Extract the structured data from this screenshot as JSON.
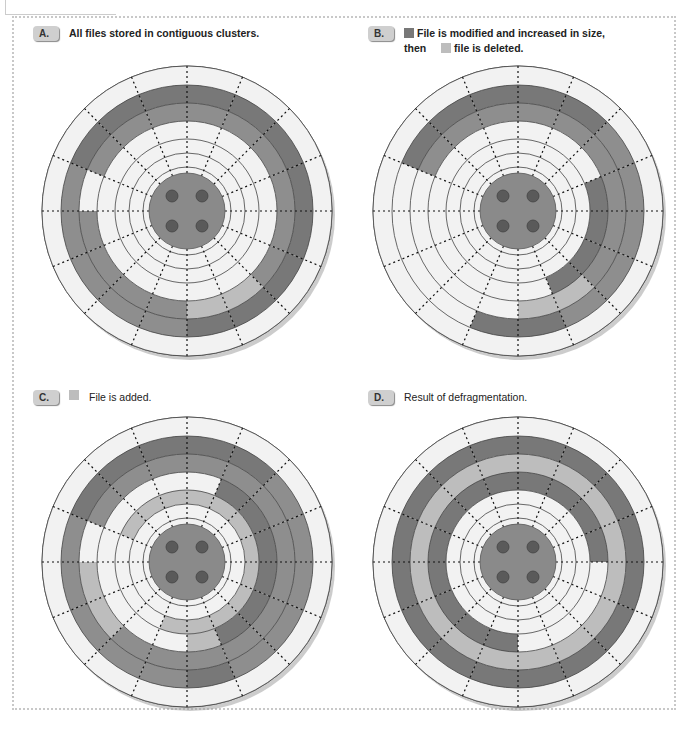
{
  "colors": {
    "white": "#f2f2f2",
    "dark": "#787878",
    "medium": "#8e8e8e",
    "light": "#bdbdbd",
    "hub": "#8a8a8a",
    "hole": "#5a5a5a"
  },
  "panels": [
    {
      "id": "A",
      "badge": "A.",
      "line1": "All files stored in contiguous clusters.",
      "line2": "",
      "swatch1": "",
      "swatch2": ""
    },
    {
      "id": "B",
      "badge": "B.",
      "line1": "File is modified and increased in size,",
      "line2_prefix": "then",
      "line2": "file is deleted.",
      "swatch1": "dark",
      "swatch2": "light"
    },
    {
      "id": "C",
      "badge": "C.",
      "line1": "File is added.",
      "line2": "",
      "swatch1": "light",
      "swatch2": ""
    },
    {
      "id": "D",
      "badge": "D.",
      "line1": "Result of defragmentation.",
      "line2": "",
      "swatch1": "",
      "swatch2": ""
    }
  ],
  "disks": [
    {
      "id": "A",
      "cx": 187,
      "cy": 211,
      "tracks": [
        [
          0,
          0,
          0,
          0,
          0,
          0,
          0,
          0,
          0,
          0,
          0,
          0,
          0,
          0,
          0,
          0
        ],
        [
          1,
          1,
          1,
          1,
          1,
          1,
          1,
          1,
          2,
          2,
          2,
          2,
          2,
          1,
          1,
          1
        ],
        [
          2,
          2,
          2,
          2,
          2,
          2,
          3,
          3,
          2,
          2,
          2,
          2,
          0,
          2,
          2,
          2
        ],
        [
          0,
          0,
          0,
          0,
          0,
          0,
          0,
          0,
          0,
          0,
          0,
          0,
          0,
          0,
          0,
          0
        ],
        [
          0,
          0,
          0,
          0,
          0,
          0,
          0,
          0,
          0,
          0,
          0,
          0,
          0,
          0,
          0,
          0
        ],
        [
          0,
          0,
          0,
          0,
          0,
          0,
          0,
          0,
          0,
          0,
          0,
          0,
          0,
          0,
          0,
          0
        ]
      ]
    },
    {
      "id": "B",
      "cx": 518,
      "cy": 211,
      "tracks": [
        [
          0,
          0,
          0,
          0,
          0,
          0,
          0,
          0,
          0,
          0,
          0,
          0,
          0,
          0,
          0,
          0
        ],
        [
          1,
          1,
          2,
          2,
          2,
          2,
          2,
          1,
          1,
          0,
          0,
          0,
          0,
          1,
          1,
          1
        ],
        [
          2,
          2,
          2,
          2,
          2,
          2,
          3,
          3,
          0,
          0,
          0,
          0,
          0,
          2,
          2,
          2
        ],
        [
          0,
          0,
          0,
          1,
          1,
          1,
          1,
          0,
          0,
          0,
          0,
          0,
          0,
          0,
          0,
          0
        ],
        [
          0,
          0,
          0,
          0,
          0,
          0,
          0,
          0,
          0,
          0,
          0,
          0,
          0,
          0,
          0,
          0
        ],
        [
          0,
          0,
          0,
          0,
          0,
          0,
          0,
          0,
          0,
          0,
          0,
          0,
          0,
          0,
          0,
          0
        ]
      ]
    },
    {
      "id": "C",
      "cx": 187,
      "cy": 562,
      "tracks": [
        [
          0,
          0,
          0,
          0,
          0,
          0,
          0,
          0,
          0,
          0,
          0,
          0,
          0,
          0,
          0,
          0
        ],
        [
          1,
          1,
          2,
          2,
          2,
          2,
          2,
          1,
          2,
          2,
          2,
          2,
          2,
          1,
          1,
          1
        ],
        [
          2,
          2,
          2,
          2,
          2,
          2,
          2,
          2,
          2,
          2,
          3,
          3,
          0,
          2,
          2,
          2
        ],
        [
          0,
          1,
          1,
          1,
          1,
          1,
          1,
          3,
          0,
          0,
          0,
          0,
          0,
          0,
          0,
          0
        ],
        [
          3,
          3,
          3,
          3,
          3,
          3,
          3,
          3,
          3,
          0,
          0,
          0,
          0,
          3,
          3,
          3
        ],
        [
          0,
          0,
          0,
          0,
          0,
          0,
          0,
          0,
          0,
          0,
          0,
          0,
          0,
          0,
          0,
          0
        ]
      ]
    },
    {
      "id": "D",
      "cx": 518,
      "cy": 562,
      "tracks": [
        [
          0,
          0,
          0,
          0,
          0,
          0,
          0,
          0,
          0,
          0,
          0,
          0,
          0,
          0,
          0,
          0
        ],
        [
          1,
          1,
          1,
          1,
          1,
          1,
          1,
          1,
          1,
          1,
          1,
          1,
          1,
          1,
          1,
          1
        ],
        [
          3,
          3,
          3,
          3,
          3,
          3,
          3,
          3,
          3,
          3,
          3,
          3,
          3,
          3,
          3,
          3
        ],
        [
          1,
          1,
          1,
          1,
          0,
          0,
          0,
          0,
          1,
          1,
          1,
          1,
          1,
          1,
          1,
          1
        ],
        [
          0,
          0,
          0,
          0,
          0,
          0,
          0,
          0,
          0,
          0,
          0,
          0,
          0,
          0,
          0,
          0
        ],
        [
          0,
          0,
          0,
          0,
          0,
          0,
          0,
          0,
          0,
          0,
          0,
          0,
          0,
          0,
          0,
          0
        ]
      ]
    }
  ],
  "geometry": {
    "radii": [
      145,
      126,
      108,
      90,
      72,
      58,
      44
    ],
    "hub": 38,
    "sectors": 16
  }
}
